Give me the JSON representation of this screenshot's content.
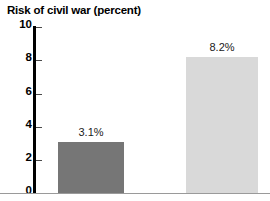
{
  "chart_data": {
    "type": "bar",
    "title": "Risk of civil war (percent)",
    "xlabel": "",
    "ylabel": "",
    "ylim": [
      0,
      10
    ],
    "grid": false,
    "legend": "none",
    "categories": [
      "",
      ""
    ],
    "values": [
      3.1,
      8.2
    ],
    "data_labels": [
      "3.1%",
      "8.2%"
    ],
    "bar_colors": [
      "#767676",
      "#d9d9d9"
    ],
    "yticks": [
      {
        "value": 10,
        "label": "10"
      },
      {
        "value": 8,
        "label": "8"
      },
      {
        "value": 6,
        "label": "6"
      },
      {
        "value": 4,
        "label": "4"
      },
      {
        "value": 2,
        "label": "2"
      },
      {
        "value": 0,
        "label": "0"
      }
    ]
  },
  "axis": {
    "tick_10": "10",
    "tick_8": "8",
    "tick_6": "6",
    "tick_4": "4",
    "tick_2": "2",
    "tick_0": "0"
  },
  "bars": {
    "first_label": "3.1%",
    "second_label": "8.2%"
  }
}
